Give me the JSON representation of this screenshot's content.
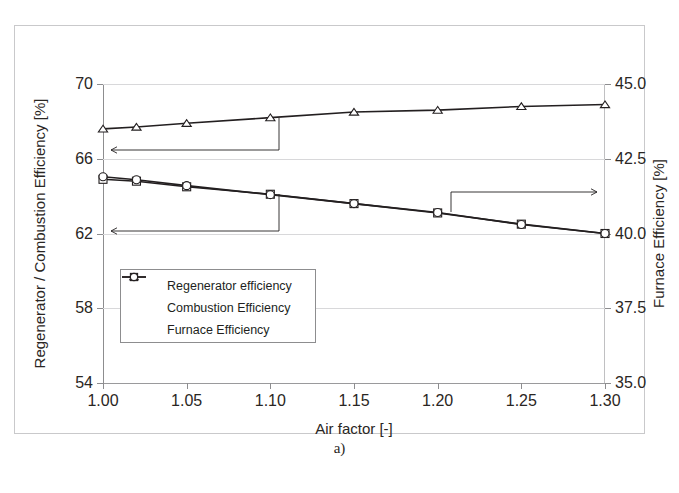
{
  "figure": {
    "caption": "a)",
    "top_bleed_text": "",
    "frame_color": "#c9c9cb"
  },
  "chart_data": {
    "type": "line",
    "title": "",
    "xlabel": "Air factor [-]",
    "ylabel": "Regenerator / Combustion Efficiency [%]",
    "ylabel_secondary": "Furnace Efficiency [%]",
    "x": [
      1.0,
      1.02,
      1.05,
      1.1,
      1.15,
      1.2,
      1.25,
      1.3
    ],
    "xlim": [
      1.0,
      1.3
    ],
    "xticks": [
      1.0,
      1.05,
      1.1,
      1.15,
      1.2,
      1.25,
      1.3
    ],
    "xticklabels": [
      "1.00",
      "1.05",
      "1.10",
      "1.15",
      "1.20",
      "1.25",
      "1.30"
    ],
    "ylim": [
      54,
      70
    ],
    "yticks": [
      54,
      58,
      62,
      66,
      70
    ],
    "yticklabels": [
      "54",
      "58",
      "62",
      "66",
      "70"
    ],
    "ylim_secondary": [
      35.0,
      45.0
    ],
    "yticks_secondary": [
      35.0,
      37.5,
      40.0,
      42.5,
      45.0
    ],
    "yticklabels_secondary": [
      "35.0",
      "37.5",
      "40.0",
      "42.5",
      "45.0"
    ],
    "grid": true,
    "legend_position": "lower-left-inside",
    "series": [
      {
        "name": "Regenerator efficiency",
        "marker": "triangle",
        "axis": "left",
        "values": [
          67.6,
          67.7,
          67.9,
          68.2,
          68.5,
          68.6,
          68.8,
          68.9
        ]
      },
      {
        "name": "Combustion Efficiency",
        "marker": "square",
        "axis": "left",
        "values": [
          64.9,
          64.8,
          64.5,
          64.1,
          63.6,
          63.1,
          62.5,
          62.0
        ]
      },
      {
        "name": "Furnace Efficiency",
        "marker": "circle",
        "axis": "right",
        "values": [
          41.9,
          41.8,
          41.6,
          41.3,
          41.0,
          40.7,
          40.3,
          40.0
        ]
      }
    ],
    "annotations": [
      {
        "name": "left-axis-pointer-upper",
        "direction": "left",
        "target_axis": "left-primary"
      },
      {
        "name": "left-axis-pointer-lower",
        "direction": "left",
        "target_axis": "left-primary"
      },
      {
        "name": "right-axis-pointer",
        "direction": "right",
        "target_axis": "right-secondary"
      }
    ]
  },
  "legend": {
    "items": [
      {
        "label": "Regenerator efficiency",
        "marker": "triangle"
      },
      {
        "label": "Combustion Efficiency",
        "marker": "square"
      },
      {
        "label": "Furnace Efficiency",
        "marker": "circle"
      }
    ]
  }
}
